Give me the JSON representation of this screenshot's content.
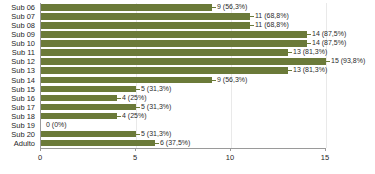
{
  "chart_data": {
    "type": "bar",
    "orientation": "horizontal",
    "title": "",
    "xlabel": "",
    "ylabel": "",
    "xlim": [
      0,
      15
    ],
    "xticks": [
      0,
      5,
      10,
      15
    ],
    "xtick_labels": [
      "0",
      "5",
      "10",
      "15"
    ],
    "grid": true,
    "grid_axis": "x",
    "legend": false,
    "bar_color": "#6b7a39",
    "categories": [
      "Sub 06",
      "Sub 07",
      "Sub 08",
      "Sub 09",
      "Sub 10",
      "Sub 11",
      "Sub 12",
      "Sub 13",
      "Sub 14",
      "Sub 15",
      "Sub 16",
      "Sub 17",
      "Sub 18",
      "Sub 19",
      "Sub 20",
      "Adulto"
    ],
    "values": [
      9,
      11,
      11,
      14,
      14,
      13,
      15,
      13,
      9,
      5,
      4,
      5,
      4,
      0,
      5,
      6
    ],
    "data_labels": [
      "9 (56,3%)",
      "11 (68,8%)",
      "11 (68,8%)",
      "14 (87,5%)",
      "14 (87,5%)",
      "13 (81,3%)",
      "15 (93,8%)",
      "13 (81,3%)",
      "9 (56,3%)",
      "5 (31,3%)",
      "4 (25%)",
      "5 (31,3%)",
      "4 (25%)",
      "0 (0%)",
      "5 (31,3%)",
      "6 (37,5%)"
    ],
    "percentages": [
      "56,3%",
      "68,8%",
      "68,8%",
      "87,5%",
      "87,5%",
      "81,3%",
      "93,8%",
      "81,3%",
      "56,3%",
      "31,3%",
      "25%",
      "31,3%",
      "25%",
      "0%",
      "31,3%",
      "37,5%"
    ]
  }
}
